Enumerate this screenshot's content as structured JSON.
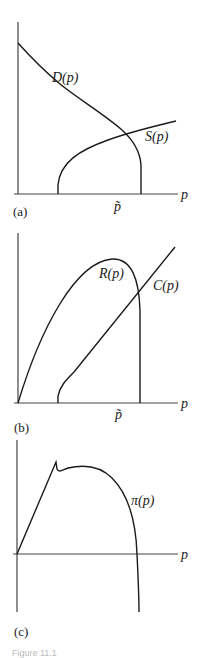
{
  "panels": {
    "a": {
      "label": "(a)",
      "x_axis_label": "p",
      "tick_label": "p̃",
      "curves": [
        {
          "name": "D(p)",
          "description": "downward-sloping demand curve, drops vertically to zero at p̃"
        },
        {
          "name": "S(p)",
          "description": "upward-sloping concave supply curve starting at positive price"
        }
      ]
    },
    "b": {
      "label": "(b)",
      "x_axis_label": "p",
      "tick_label": "p̃",
      "curves": [
        {
          "name": "R(p)",
          "description": "revenue curve, hump-shaped, drops vertically at p̃"
        },
        {
          "name": "C(p)",
          "description": "cost curve, rising roughly linearly from positive price"
        }
      ]
    },
    "c": {
      "label": "(c)",
      "x_axis_label": "p",
      "curves": [
        {
          "name": "π(p)",
          "description": "profit curve, rising linearly then kink, hump, falls below axis"
        }
      ]
    }
  },
  "caption": "Figure 11.1"
}
